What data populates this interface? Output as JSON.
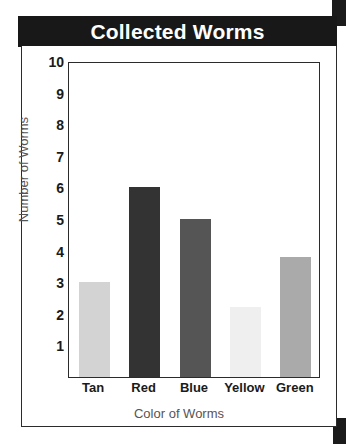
{
  "title": "Collected Worms",
  "chart_data": {
    "type": "bar",
    "title": "Collected Worms",
    "xlabel": "Color of Worms",
    "ylabel": "Number of Worms",
    "categories": [
      "Tan",
      "Red",
      "Blue",
      "Yellow",
      "Green"
    ],
    "values": [
      3.0,
      6.0,
      5.0,
      2.2,
      3.8
    ],
    "colors": [
      "#d3d3d3",
      "#333333",
      "#555555",
      "#efefef",
      "#aaaaaa"
    ],
    "ylim": [
      0,
      10
    ],
    "yticks": [
      1,
      2,
      3,
      4,
      5,
      6,
      7,
      8,
      9,
      10
    ],
    "ytick_labels": [
      "1",
      "2",
      "3",
      "4",
      "5",
      "6",
      "7",
      "8",
      "9",
      "10"
    ],
    "grid": false,
    "legend": "none"
  },
  "theme": {
    "banner_bg": "#181818",
    "banner_text": "#ffffff",
    "frame": "#2b2b2b",
    "axis_text": "#1a1a1a",
    "axis_title_text": "#555555"
  }
}
